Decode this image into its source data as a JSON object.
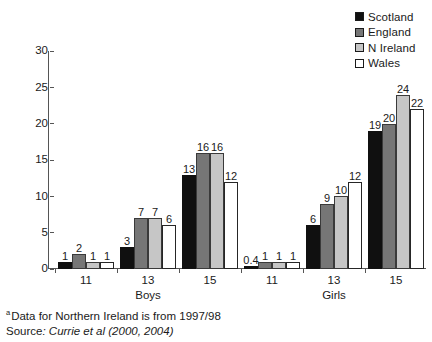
{
  "legend": {
    "items": [
      {
        "label": "Scotland",
        "color": "#101010",
        "key": "scotland"
      },
      {
        "label": "England",
        "color": "#767676",
        "key": "england"
      },
      {
        "label": "N Ireland",
        "color": "#c6c6c6",
        "key": "nireland"
      },
      {
        "label": "Wales",
        "color": "#ffffff",
        "key": "wales"
      }
    ]
  },
  "axis": {
    "y_ticks": [
      "0",
      "5",
      "10",
      "15",
      "20",
      "25",
      "30"
    ],
    "x_group_labels": [
      "11",
      "13",
      "15",
      "11",
      "13",
      "15"
    ],
    "x_section_labels": [
      "Boys",
      "Girls"
    ]
  },
  "bar_labels": {
    "boys_11": [
      "1",
      "2",
      "1",
      "1"
    ],
    "boys_13": [
      "3",
      "7",
      "7",
      "6"
    ],
    "boys_15": [
      "13",
      "16",
      "16",
      "12"
    ],
    "girls_11": [
      "0.4",
      "1",
      "1",
      "1"
    ],
    "girls_13": [
      "6",
      "9",
      "10",
      "12"
    ],
    "girls_15": [
      "19",
      "20",
      "24",
      "22"
    ]
  },
  "footnotes": {
    "marker": "a",
    "note": "Data for Northern Ireland is from 1997/98",
    "source_prefix": "Source",
    "source_rest": ": Currie et al (2000, 2004)"
  },
  "chart_data": {
    "type": "bar",
    "title": "",
    "subtitle": "",
    "xlabel": "",
    "ylabel": "",
    "ylim": [
      0,
      30
    ],
    "yticks": [
      0,
      5,
      10,
      15,
      20,
      25,
      30
    ],
    "grid": false,
    "legend_position": "top-right",
    "categories": [
      "Boys 11",
      "Boys 13",
      "Boys 15",
      "Girls 11",
      "Girls 13",
      "Girls 15"
    ],
    "category_groups": [
      {
        "name": "Boys",
        "categories": [
          "11",
          "13",
          "15"
        ]
      },
      {
        "name": "Girls",
        "categories": [
          "11",
          "13",
          "15"
        ]
      }
    ],
    "series": [
      {
        "name": "Scotland",
        "color": "#101010",
        "values": [
          1,
          3,
          13,
          0.4,
          6,
          19
        ]
      },
      {
        "name": "England",
        "color": "#767676",
        "values": [
          2,
          7,
          16,
          1,
          9,
          20
        ]
      },
      {
        "name": "N Ireland",
        "color": "#c6c6c6",
        "values": [
          1,
          7,
          16,
          1,
          10,
          24
        ]
      },
      {
        "name": "Wales",
        "color": "#ffffff",
        "values": [
          1,
          6,
          12,
          1,
          12,
          22
        ]
      }
    ],
    "annotations": [
      "a Data for Northern Ireland is from 1997/98",
      "Source: Currie et al (2000, 2004)"
    ]
  }
}
